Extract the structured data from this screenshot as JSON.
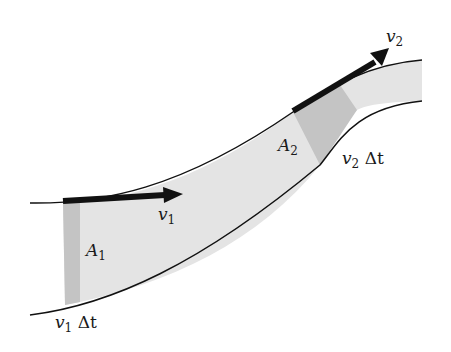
{
  "figure": {
    "colors": {
      "tube_fill": "#e4e4e4",
      "band_fill": "#c4c4c4",
      "outline": "#111111",
      "arrow": "#111111"
    },
    "labels": {
      "v1": {
        "base": "v",
        "sub": "1"
      },
      "v2": {
        "base": "v",
        "sub": "2"
      },
      "A1": {
        "base": "A",
        "sub": "1"
      },
      "A2": {
        "base": "A",
        "sub": "2"
      },
      "v1dt": {
        "base": "v",
        "sub": "1",
        "suffix": "Δt"
      },
      "v2dt": {
        "base": "v",
        "sub": "2",
        "suffix": "Δt"
      }
    }
  }
}
